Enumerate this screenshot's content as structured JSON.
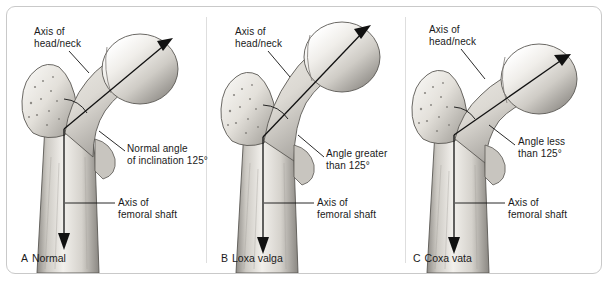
{
  "figure": {
    "type": "anatomical-illustration",
    "panel_count": 3
  },
  "panels": [
    {
      "id": "A",
      "letter": "A",
      "caption": "Normal",
      "labels": {
        "head_neck_axis": [
          "Axis of",
          "head/neck"
        ],
        "angle": [
          "Normal angle",
          "of inclination 125°"
        ],
        "shaft_axis": [
          "Axis of",
          "femoral shaft"
        ]
      },
      "angle_degrees": 125,
      "angle_description": "Normal angle of inclination 125°"
    },
    {
      "id": "B",
      "letter": "B",
      "caption": "Loxa valga",
      "labels": {
        "head_neck_axis": [
          "Axis of",
          "head/neck"
        ],
        "angle": [
          "Angle greater",
          "than 125°"
        ],
        "shaft_axis": [
          "Axis of",
          "femoral shaft"
        ]
      },
      "angle_degrees": 140,
      "angle_description": "Angle greater than 125°"
    },
    {
      "id": "C",
      "letter": "C",
      "caption": "Coxa vata",
      "labels": {
        "head_neck_axis": [
          "Axis of",
          "head/neck"
        ],
        "angle": [
          "Angle less",
          "than 125°"
        ],
        "shaft_axis": [
          "Axis of",
          "femoral shaft"
        ]
      },
      "angle_degrees": 110,
      "angle_description": "Angle less than 125°"
    }
  ],
  "colors": {
    "frame_border": "#c9c9c9",
    "divider": "#dedede",
    "text": "#1a1a1a",
    "bone_light": "#f4f2ee",
    "bone_mid": "#d2cfc9",
    "bone_dark": "#8d8a85",
    "outline": "#4a4845",
    "axis_line": "#111111",
    "background": "#ffffff"
  }
}
